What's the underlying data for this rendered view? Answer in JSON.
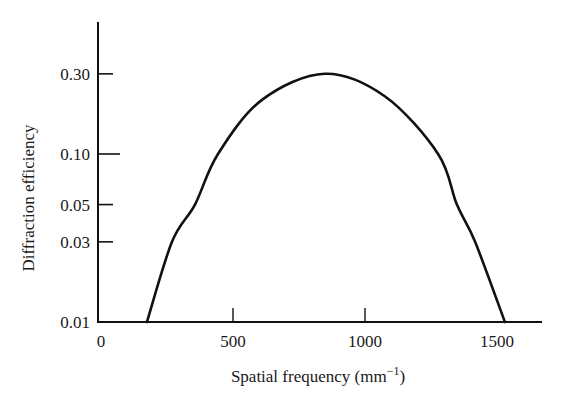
{
  "chart_data": {
    "type": "line",
    "title": "",
    "xlabel": "Spatial frequency (mm⁻¹)",
    "xlabel_main": "Spatial frequency (mm",
    "xlabel_sup": "−1",
    "xlabel_close": ")",
    "ylabel": "Diffraction efficiency",
    "x_scale": "linear",
    "y_scale": "log",
    "xlim": [
      0,
      1650
    ],
    "ylim": [
      0.01,
      0.6
    ],
    "grid": false,
    "legend": null,
    "x_ticks": [
      {
        "value": 0,
        "label": "0",
        "tick_mark": false
      },
      {
        "value": 500,
        "label": "500",
        "tick_mark": true
      },
      {
        "value": 1000,
        "label": "1000",
        "tick_mark": true
      },
      {
        "value": 1500,
        "label": "1500",
        "tick_mark": false
      }
    ],
    "y_ticks": [
      {
        "value": 0.01,
        "label": "0.01"
      },
      {
        "value": 0.03,
        "label": "0.03"
      },
      {
        "value": 0.05,
        "label": "0.05"
      },
      {
        "value": 0.1,
        "label": "0.10"
      },
      {
        "value": 0.3,
        "label": "0.30"
      }
    ],
    "series": [
      {
        "name": "Diffraction efficiency",
        "color": "#111111",
        "x": [
          174,
          269,
          356,
          443,
          610,
          848,
          1076,
          1277,
          1348,
          1417,
          1530
        ],
        "y": [
          0.01,
          0.03,
          0.05,
          0.1,
          0.21,
          0.3,
          0.22,
          0.1,
          0.05,
          0.03,
          0.01
        ]
      }
    ],
    "peak": {
      "x": 848,
      "y": 0.3
    }
  },
  "colors": {
    "background": "#ffffff",
    "ink": "#111111"
  }
}
